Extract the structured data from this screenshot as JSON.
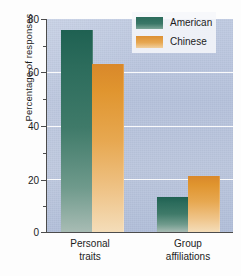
{
  "chart_data": {
    "type": "bar",
    "title": "",
    "xlabel": "",
    "ylabel": "Percentage of responses",
    "categories": [
      "Personal traits",
      "Group affiliations"
    ],
    "category_lines": [
      {
        "line1": "Personal",
        "line2": "traits"
      },
      {
        "line1": "Group",
        "line2": "affiliations"
      }
    ],
    "series": [
      {
        "name": "American",
        "color": "#2d6b5f",
        "values": [
          76,
          13
        ]
      },
      {
        "name": "Chinese",
        "color": "#e0922f",
        "values": [
          63,
          21
        ]
      }
    ],
    "ylim": [
      0,
      80
    ],
    "yticks": [
      0,
      20,
      40,
      60,
      80
    ],
    "ytick_labels": [
      "0",
      "20",
      "40",
      "60",
      "80"
    ],
    "yminor_ticks": [
      10,
      30,
      50,
      70
    ],
    "grid": "horizontal-major-white",
    "legend_position": "top-right-inside"
  },
  "legend": {
    "items": [
      {
        "label": "American"
      },
      {
        "label": "Chinese"
      }
    ]
  },
  "colors": {
    "plot_background": "#b8c4dd",
    "gridline": "#fdfdfd",
    "axis": "#4c4c4c",
    "american": "#2d6b5f",
    "chinese": "#e0922f",
    "page_background": "#fdfdfd",
    "text": "#1c1c1c"
  }
}
